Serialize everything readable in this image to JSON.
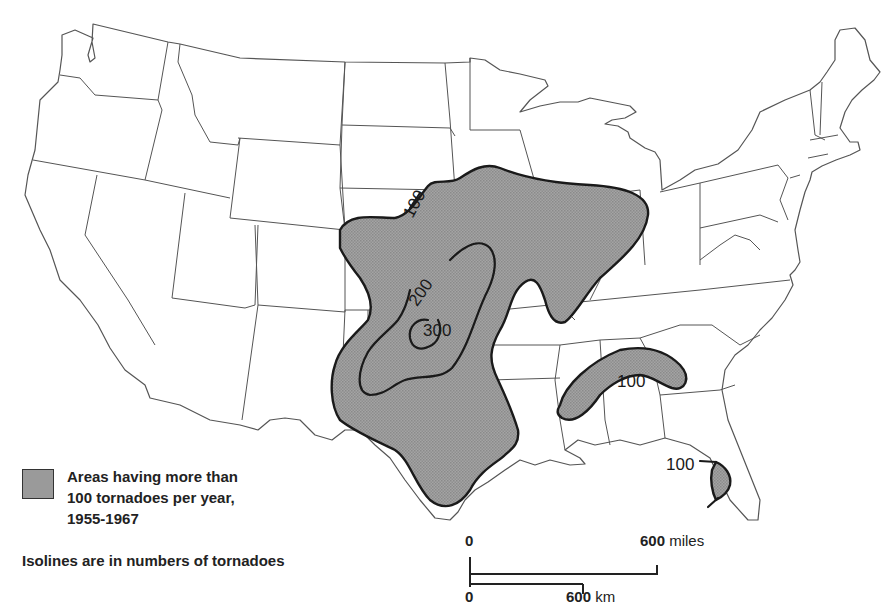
{
  "map": {
    "subject": "Tornado frequency in the United States",
    "shading_color": "#9a9a9a",
    "line_color": "#1a1a1a",
    "isolines": [
      {
        "value": "100",
        "label": "100",
        "region": "Great Plains / Midwest (outer boundary)"
      },
      {
        "value": "200",
        "label": "200",
        "region": "Kansas / Oklahoma"
      },
      {
        "value": "300",
        "label": "300",
        "region": "Central Oklahoma"
      },
      {
        "value": "100",
        "label": "100",
        "region": "Mississippi / Alabama / Georgia"
      },
      {
        "value": "100",
        "label": "100",
        "region": "Central Florida"
      }
    ]
  },
  "legend": {
    "swatch_label_lines": [
      "Areas having more than",
      "100 tornadoes per year,",
      "1955-1967"
    ],
    "note": "Isolines are in numbers of tornadoes"
  },
  "scale_bar": {
    "miles": {
      "start": "0",
      "end": "600",
      "unit": "miles"
    },
    "km": {
      "start": "0",
      "end": "600",
      "unit": "km"
    }
  }
}
